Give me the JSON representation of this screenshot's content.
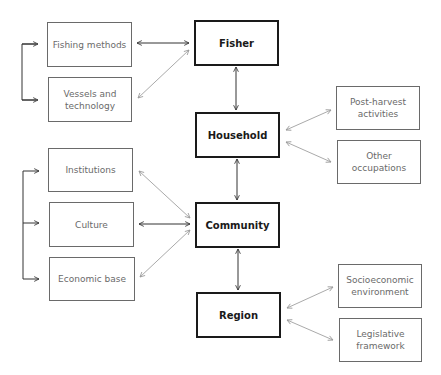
{
  "diagram": {
    "main_nodes": [
      {
        "id": "fisher",
        "label": "Fisher"
      },
      {
        "id": "household",
        "label": "Household"
      },
      {
        "id": "community",
        "label": "Community"
      },
      {
        "id": "region",
        "label": "Region"
      }
    ],
    "fisher_factors": [
      {
        "id": "fishing-methods",
        "label": "Fishing methods"
      },
      {
        "id": "vessels-technology",
        "label": "Vessels and technology"
      }
    ],
    "household_factors": [
      {
        "id": "post-harvest",
        "label": "Post-harvest activities"
      },
      {
        "id": "other-occupations",
        "label": "Other occupations"
      }
    ],
    "community_factors": [
      {
        "id": "institutions",
        "label": "Institutions"
      },
      {
        "id": "culture",
        "label": "Culture"
      },
      {
        "id": "economic-base",
        "label": "Economic base"
      }
    ],
    "region_factors": [
      {
        "id": "socioeconomic",
        "label": "Socioeconomic environment"
      },
      {
        "id": "legislative",
        "label": "Legislative framework"
      }
    ],
    "colors": {
      "main_border": "#1a1a1a",
      "sub_border": "#6a6a6a",
      "dark_arrow": "#333333",
      "light_arrow": "#aaaaaa"
    }
  }
}
